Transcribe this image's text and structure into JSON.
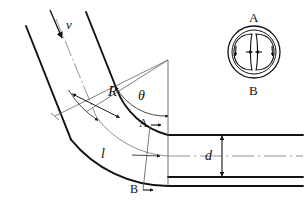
{
  "figure": {
    "background_color": "#ffffff",
    "line_color": "#111111",
    "thin_line_color": "#555555"
  },
  "labels": {
    "velocity": "v",
    "radius": "R",
    "angle": "θ",
    "arc_length": "l",
    "diameter": "d",
    "section_top": "A",
    "section_bottom": "B",
    "inset_top": "A",
    "inset_bottom": "B"
  },
  "geometry": {
    "bend_center": {
      "x": 168,
      "y": 60
    },
    "bend_angle_deg": 50,
    "outer_radius": 126,
    "center_radius": 96,
    "inner_radius": 75,
    "pipe_diameter_px": 42,
    "outlet_top_y": 135,
    "outlet_center_y": 156,
    "outlet_bottom_y": 177,
    "outlet_end_x": 303,
    "section_line_x_top": 150,
    "section_line_x_bottom": 143
  },
  "inset": {
    "name": "secondary-flow-cross-section",
    "center": {
      "x": 254,
      "y": 52
    },
    "outer_radius": 26,
    "inner_radius": 22,
    "vortex_count": 2,
    "description": "Circular pipe cross section showing two counter-rotating Dean vortices"
  },
  "annotations": {
    "velocity_arrow": "inlet velocity direction along the pipe centerline",
    "radius_dimension": "double-headed arrow across the bend wall thickness marking R",
    "angle_arc": "arc with arrowheads measuring the bend angle theta",
    "arc_length_arrow": "arrow along the curved centerline marking length l",
    "diameter_dimension": "double-headed vertical arrow between pipe walls marking d",
    "section_markers": "section line A-A / B-B cutting across the outlet pipe"
  }
}
